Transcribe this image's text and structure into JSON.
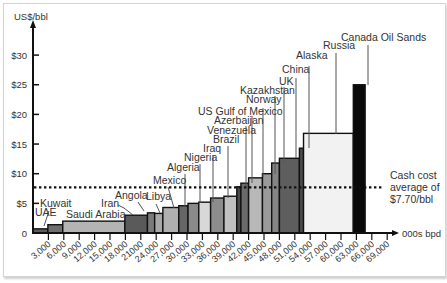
{
  "chart_data": {
    "type": "bar",
    "variant": "variable-width cost curve",
    "title": "",
    "ylabel": "US$/bbl",
    "xlabel": "000s bpd",
    "xlim": [
      0,
      70000
    ],
    "ylim": [
      0,
      33
    ],
    "yticks": [
      {
        "value": 0,
        "label": "0"
      },
      {
        "value": 5,
        "label": "$5"
      },
      {
        "value": 10,
        "label": "$10"
      },
      {
        "value": 15,
        "label": "$15"
      },
      {
        "value": 20,
        "label": "$20"
      },
      {
        "value": 25,
        "label": "$25"
      },
      {
        "value": 30,
        "label": "$30"
      }
    ],
    "xticks": [
      {
        "value": 3000,
        "label": "3,000"
      },
      {
        "value": 6000,
        "label": "6,000"
      },
      {
        "value": 9000,
        "label": "9,000"
      },
      {
        "value": 12000,
        "label": "12,000"
      },
      {
        "value": 15000,
        "label": "15,000"
      },
      {
        "value": 18000,
        "label": "18,000"
      },
      {
        "value": 21000,
        "label": "21000"
      },
      {
        "value": 24000,
        "label": "24,000"
      },
      {
        "value": 27000,
        "label": "27,000"
      },
      {
        "value": 30000,
        "label": "30,000"
      },
      {
        "value": 33000,
        "label": "33,000"
      },
      {
        "value": 36000,
        "label": "36,000"
      },
      {
        "value": 39000,
        "label": "39,000"
      },
      {
        "value": 42000,
        "label": "42,000"
      },
      {
        "value": 45000,
        "label": "45,000"
      },
      {
        "value": 48000,
        "label": "48,000"
      },
      {
        "value": 51000,
        "label": "51,000"
      },
      {
        "value": 54000,
        "label": "54,000"
      },
      {
        "value": 57000,
        "label": "57,000"
      },
      {
        "value": 60000,
        "label": "60,000"
      },
      {
        "value": 63000,
        "label": "63,000"
      },
      {
        "value": 66000,
        "label": "66,000"
      },
      {
        "value": 69000,
        "label": "69,000"
      }
    ],
    "series": [
      {
        "name": "UAE",
        "x0": 0,
        "x1": 2900,
        "value": 0.7,
        "color": "#5c5c5c"
      },
      {
        "name": "Kuwait",
        "x0": 2900,
        "x1": 5800,
        "value": 1.4,
        "color": "#6e6e6e"
      },
      {
        "name": "Saudi Arabia",
        "x0": 5800,
        "x1": 17900,
        "value": 2.0,
        "color": "#b4b4b4"
      },
      {
        "name": "Iran",
        "x0": 17900,
        "x1": 22300,
        "value": 3.0,
        "color": "#5a5a5a"
      },
      {
        "name": "Angola",
        "x0": 22300,
        "x1": 23700,
        "value": 3.4,
        "color": "#7a7a7a"
      },
      {
        "name": "Libya",
        "x0": 23700,
        "x1": 25300,
        "value": 3.3,
        "color": "#a8a8a8"
      },
      {
        "name": "Mexico",
        "x0": 25300,
        "x1": 28400,
        "value": 4.3,
        "color": "#b0b0b0"
      },
      {
        "name": "Algeria",
        "x0": 28400,
        "x1": 30200,
        "value": 4.6,
        "color": "#666666"
      },
      {
        "name": "Nigeria",
        "x0": 30200,
        "x1": 32300,
        "value": 5.0,
        "color": "#8a8a8a"
      },
      {
        "name": "Iraq",
        "x0": 32300,
        "x1": 34600,
        "value": 5.2,
        "color": "#d8d8d8"
      },
      {
        "name": "Brazil",
        "x0": 34600,
        "x1": 37200,
        "value": 5.9,
        "color": "#8c8c8c"
      },
      {
        "name": "Venezuela",
        "x0": 37200,
        "x1": 39700,
        "value": 6.2,
        "color": "#c0c0c0"
      },
      {
        "name": "Azerbaijan",
        "x0": 39700,
        "x1": 40500,
        "value": 7.8,
        "color": "#4a4a4a"
      },
      {
        "name": "US Gulf of Mexico",
        "x0": 40500,
        "x1": 42000,
        "value": 8.4,
        "color": "#6a6a6a"
      },
      {
        "name": "Norway",
        "x0": 42000,
        "x1": 44700,
        "value": 9.3,
        "color": "#b8b8b8"
      },
      {
        "name": "Kazakhstan",
        "x0": 44700,
        "x1": 46500,
        "value": 10.0,
        "color": "#9a9a9a"
      },
      {
        "name": "UK",
        "x0": 46500,
        "x1": 48000,
        "value": 11.8,
        "color": "#858585"
      },
      {
        "name": "China",
        "x0": 48000,
        "x1": 51900,
        "value": 12.6,
        "color": "#5e5e5e"
      },
      {
        "name": "Alaska",
        "x0": 51900,
        "x1": 52700,
        "value": 14.3,
        "color": "#4c4c4c"
      },
      {
        "name": "Russia",
        "x0": 52700,
        "x1": 62400,
        "value": 16.8,
        "color": "#f2f2f2"
      },
      {
        "name": "Canada Oil Sands",
        "x0": 62400,
        "x1": 64700,
        "value": 25.0,
        "color": "#0a0a0a"
      }
    ],
    "reference_line": {
      "value": 7.7,
      "style": "dotted",
      "label_lines": [
        "Cash cost",
        "average of",
        "$7.70/bbl"
      ]
    },
    "legend": "none",
    "grid": false
  }
}
